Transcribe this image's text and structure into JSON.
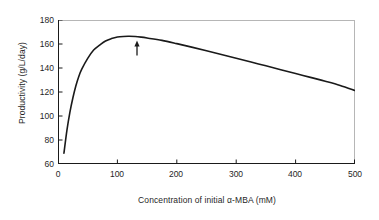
{
  "chart_data": {
    "type": "line",
    "title": "",
    "xlabel": "Concentration of initial α-MBA (mM)",
    "ylabel": "Productivity (g/L/day)",
    "xlim": [
      0,
      500
    ],
    "ylim": [
      60,
      180
    ],
    "xticks": [
      0,
      100,
      200,
      300,
      400,
      500
    ],
    "yticks": [
      60,
      80,
      100,
      120,
      140,
      160,
      180
    ],
    "xtick_labels": [
      "0",
      "100",
      "200",
      "300",
      "400",
      "500"
    ],
    "ytick_labels": [
      "60",
      "80",
      "100",
      "120",
      "140",
      "160",
      "180"
    ],
    "grid": false,
    "legend": null,
    "series": [
      {
        "name": "Productivity",
        "color": "#1a1a1a",
        "x": [
          10,
          15,
          20,
          25,
          30,
          35,
          40,
          50,
          60,
          70,
          80,
          90,
          100,
          110,
          120,
          130,
          140,
          150,
          175,
          200,
          225,
          250,
          275,
          300,
          325,
          350,
          375,
          400,
          425,
          450,
          475,
          500
        ],
        "y": [
          69,
          88,
          103,
          115,
          125,
          133,
          139,
          148,
          155,
          159,
          162.5,
          164.5,
          165.8,
          166.3,
          166.4,
          166.2,
          165.7,
          165.0,
          163.0,
          160.3,
          157.4,
          154.4,
          151.3,
          148.2,
          145.0,
          141.8,
          138.6,
          135.4,
          132.2,
          129.0,
          125.5,
          121.2
        ]
      }
    ],
    "annotations": [
      {
        "type": "arrow-up",
        "x": 133,
        "y_tail": 150.5,
        "y_head": 163.0,
        "label": ""
      }
    ]
  },
  "axis": {
    "axis_color": "#1a1a1a",
    "frame_color": "#b6b6b6",
    "curve_color": "#1a1a1a",
    "background": "#ffffff"
  }
}
